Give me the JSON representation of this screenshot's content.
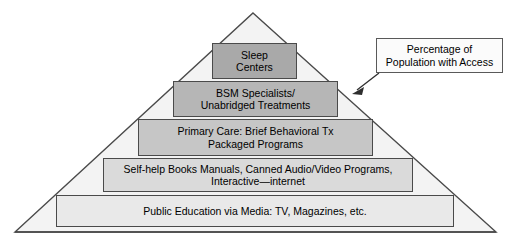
{
  "diagram": {
    "shape": "pyramid",
    "outline_color": "#4a4a4a",
    "background_color": "#ffffff",
    "tiers": [
      {
        "level": 1,
        "label": "Sleep\nCenters",
        "fill": "#a9a9a9"
      },
      {
        "level": 2,
        "label": "BSM Specialists/\nUnabridged Treatments",
        "fill": "#b6b6b6"
      },
      {
        "level": 3,
        "label": "Primary Care: Brief Behavioral Tx\nPackaged Programs",
        "fill": "#c6c6c6"
      },
      {
        "level": 4,
        "label": "Self-help Books Manuals, Canned Audio/Video Programs,\nInteractive—internet",
        "fill": "#dadada"
      },
      {
        "level": 5,
        "label": "Public Education via Media: TV, Magazines, etc.",
        "fill": "#e9e9e9"
      }
    ]
  },
  "annotation": {
    "text": "Percentage of\nPopulation with Access",
    "pointer": "arrow-down-left",
    "border_color": "#595959"
  }
}
